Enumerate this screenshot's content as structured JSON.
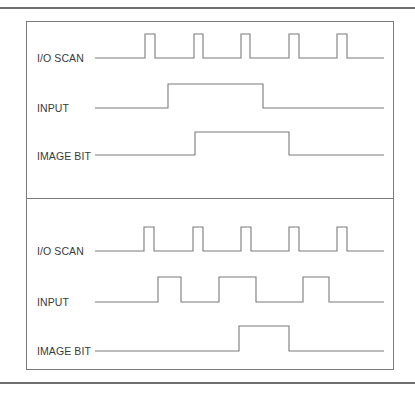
{
  "panels": [
    {
      "id": "top",
      "signals": [
        {
          "label": "I/O SCAN",
          "points": "95,58 145,58 145,34 155,34 155,58 194,58 194,34 203,34 203,58 241,58 241,34 250,34 250,58 289,58 289,34 299,34 299,58 337,58 337,34 347,34 347,58 384,58"
        },
        {
          "label": "INPUT",
          "points": "95,108 168,108 168,84 263,84 263,108 384,108"
        },
        {
          "label": "IMAGE BIT",
          "points": "95,155 195,155 195,132 289,132 289,155 384,155"
        }
      ]
    },
    {
      "id": "bottom",
      "signals": [
        {
          "label": "I/O SCAN",
          "points": "95,251 144,251 144,227 154,227 154,251 193,251 193,227 203,227 203,251 241,251 241,227 251,227 251,251 289,251 289,227 299,227 299,251 337,251 337,227 347,227 347,251 384,251"
        },
        {
          "label": "INPUT",
          "points": "95,302 158,302 158,277 181,277 181,302 219,302 219,277 256,277 256,302 303,302 303,277 329,277 329,302 384,302"
        },
        {
          "label": "IMAGE BIT",
          "points": "95,351 239,351 239,326 289,326 289,351 384,351"
        }
      ]
    }
  ],
  "colors": {
    "line": "#7a7a7a",
    "text": "#3a3a3a"
  }
}
